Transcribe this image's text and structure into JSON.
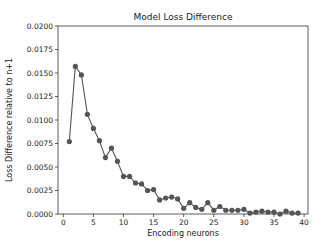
{
  "chart_data": {
    "type": "line",
    "title": "Model Loss Difference",
    "xlabel": "Encoding neurons",
    "ylabel": "Loss Difference relative to n+1",
    "xlim": [
      -1.5,
      41.5
    ],
    "ylim": [
      0,
      0.02
    ],
    "xticks": [
      0,
      5,
      10,
      15,
      20,
      25,
      30,
      35,
      40
    ],
    "yticks": [
      0.0,
      0.0025,
      0.005,
      0.0075,
      0.01,
      0.0125,
      0.015,
      0.0175,
      0.02
    ],
    "ytick_labels": [
      "0.0000",
      "0.0025",
      "0.0050",
      "0.0075",
      "0.0100",
      "0.0125",
      "0.0150",
      "0.0175",
      "0.0200"
    ],
    "grid": false,
    "legend": null,
    "series": [
      {
        "name": "Loss difference",
        "color": "#555555",
        "marker": "circle",
        "x": [
          1,
          2,
          3,
          4,
          5,
          6,
          7,
          8,
          9,
          10,
          11,
          12,
          13,
          14,
          15,
          16,
          17,
          18,
          19,
          20,
          21,
          22,
          23,
          24,
          25,
          26,
          27,
          28,
          29,
          30,
          31,
          32,
          33,
          34,
          35,
          36,
          37,
          38,
          39
        ],
        "values": [
          0.0077,
          0.0157,
          0.0148,
          0.0106,
          0.0091,
          0.0078,
          0.006,
          0.007,
          0.0056,
          0.004,
          0.004,
          0.0033,
          0.0032,
          0.0025,
          0.0026,
          0.0015,
          0.0017,
          0.0018,
          0.0016,
          0.0006,
          0.0012,
          0.0007,
          0.0005,
          0.0012,
          0.0004,
          0.0008,
          0.0004,
          0.0004,
          0.0004,
          0.0005,
          0.0001,
          0.0002,
          0.0003,
          0.0002,
          0.0002,
          0.0,
          0.0003,
          0.0001,
          0.0001
        ]
      }
    ]
  }
}
